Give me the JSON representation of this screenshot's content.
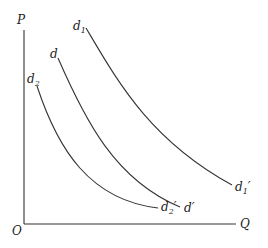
{
  "diagram": {
    "axes": {
      "y_label": "P",
      "x_label": "Q",
      "origin_label": "O"
    },
    "curves": [
      {
        "name": "d1",
        "start_label": "d",
        "start_sub": "1",
        "end_label": "d",
        "end_sub": "1",
        "end_prime": "′"
      },
      {
        "name": "d",
        "start_label": "d",
        "start_sub": "",
        "end_label": "d",
        "end_sub": "",
        "end_prime": "′"
      },
      {
        "name": "d2",
        "start_label": "d",
        "start_sub": "2",
        "end_label": "d",
        "end_sub": "2",
        "end_prime": "′"
      }
    ],
    "colors": {
      "line": "#333333",
      "text": "#222222",
      "background": "#ffffff"
    }
  }
}
